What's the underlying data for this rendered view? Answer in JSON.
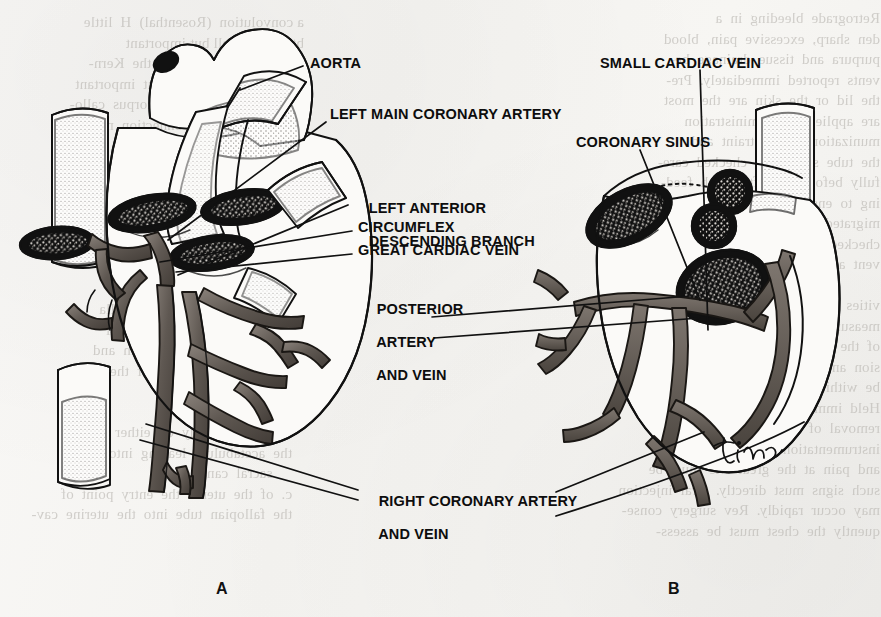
{
  "figure": {
    "panels": [
      {
        "id": "A",
        "view": "anterior",
        "x": 216,
        "y": 588
      },
      {
        "id": "B",
        "view": "posterior",
        "x": 668,
        "y": 588
      }
    ],
    "signature": "Tina",
    "background_color": "#f7f6f4",
    "ink_color": "#111111",
    "vessel_fill": "#6e6660"
  },
  "labels": [
    {
      "name": "aorta",
      "lines": [
        "AORTA"
      ],
      "x": 310,
      "y": 62
    },
    {
      "name": "left-main-coronary-artery",
      "lines": [
        "LEFT MAIN CORONARY ARTERY"
      ],
      "x": 330,
      "y": 113
    },
    {
      "name": "left-anterior-descending",
      "lines": [
        "LEFT ANTERIOR",
        "DESCENDING BRANCH"
      ],
      "x": 352,
      "y": 190
    },
    {
      "name": "circumflex",
      "lines": [
        "CIRCUMFLEX"
      ],
      "x": 358,
      "y": 226
    },
    {
      "name": "great-cardiac-vein",
      "lines": [
        "GREAT CARDIAC VEIN"
      ],
      "x": 358,
      "y": 249
    },
    {
      "name": "posterior-artery-and-vein",
      "lines": [
        "POSTERIOR",
        "ARTERY",
        "AND VEIN"
      ],
      "x": 360,
      "y": 291
    },
    {
      "name": "small-cardiac-vein",
      "lines": [
        "SMALL CARDIAC VEIN"
      ],
      "x": 600,
      "y": 62
    },
    {
      "name": "coronary-sinus",
      "lines": [
        "CORONARY SINUS"
      ],
      "x": 576,
      "y": 141
    },
    {
      "name": "right-coronary-artery-and-vein",
      "lines": [
        "RIGHT CORONARY ARTERY",
        "AND VEIN"
      ],
      "x": 362,
      "y": 483
    }
  ],
  "bleed_text": {
    "col_left": "a convolution  (Rosenthal)  H  little\nbtool.  A small but important\n  contributory  branch is the  Kern-\nohan  artery,  a  small  but  important\n  hemispheres  and  the  corpus  callo-\n  corpu  callosum  connection  may\n  be  seen  at  the  level  of  the  ventri-\n  cle  and  the  third  ventricle\n\n   be  the  vessels  of  the  two  up-\n   increases  of  arterial  supply\n\n   medulla  and  the  pons  arise\n   of  the  cord.  The  anterior\n   lower  portion  of  the  medulla\n   contributes  the  main  arterial\n   surface  of  the  brain  stem  and\n   the  posterior  surface  of  the\n   the  basilar  artery\n\n   arising  anteriorly  on  either\n   the  acetabulum  leading  into  the\n        sacral  canal\n   c.  of  the  uterus  the  entry  point  of\n   the  fallopian  tube  into  the  uterine  cav-",
    "col_right": "Retrograde  bleeding  in  a\nden  sharp,  excessive  pain,  blood\npurpura  and  tissue  drainage  be-\nvents  reported  immediately.  Pre-\nthe  lid  or  the  skin  are  the  most\nare  applied  for  administration\nmunization  and  restraint  and\nthe  tube  should  be  checked  care-\nfully  before  and  after  each  feed-\ning  to  ensure  the  tube  has  not\nmigrated.  Gastric  residuals  are\nchecked  every  four  hours  to  pre-\nvent  aspiration\n\nvities  in  the  chest  must  be  com-\nmeasured  and  documented  as-\nof  the  patient  in  a  semi-\nsion  and  the  personal  the  should\nbe  within  reach  of  his  right\nHeld  immediately  at  the  end  of\nremoval  of  the  chest  tube  in  his\ninstrumentation  abdominal  pain\nand  pain  at  the  great  site  must  be\nsuch  signs  must  directly.  Oral  injection\nmay  occur  rapidly.  Rev  surgery  conse-\nquently  the  chest  must  be  assess-"
  }
}
